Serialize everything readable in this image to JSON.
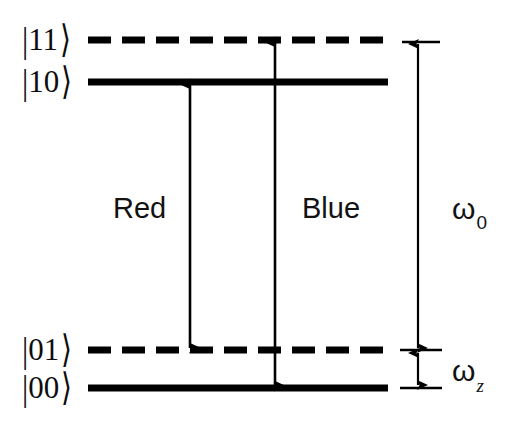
{
  "figure": {
    "width": 527,
    "height": 422,
    "background_color": "#ffffff",
    "line_color": "#000000"
  },
  "levels": [
    {
      "id": "level-11",
      "label": "|11⟩",
      "label_ket": "11",
      "style": "dashed",
      "y": 40,
      "x_start": 88,
      "x_end": 388,
      "label_x": 22,
      "label_y": 24
    },
    {
      "id": "level-10",
      "label": "|10⟩",
      "label_ket": "10",
      "style": "solid",
      "y": 82,
      "x_start": 88,
      "x_end": 388,
      "label_x": 22,
      "label_y": 66
    },
    {
      "id": "level-01",
      "label": "|01⟩",
      "label_ket": "01",
      "style": "dashed",
      "y": 350,
      "x_start": 88,
      "x_end": 388,
      "label_x": 22,
      "label_y": 334
    },
    {
      "id": "level-00",
      "label": "|00⟩",
      "label_ket": "00",
      "style": "solid",
      "y": 388,
      "x_start": 88,
      "x_end": 388,
      "label_x": 22,
      "label_y": 372
    }
  ],
  "transitions": [
    {
      "id": "red-transition",
      "label": "Red",
      "x": 190,
      "y_top": 82,
      "y_bottom": 350,
      "from_level": "|10⟩",
      "to_level": "|01⟩",
      "arrowheads": "both",
      "label_x": 113,
      "label_y": 194
    },
    {
      "id": "blue-transition",
      "label": "Blue",
      "x": 275,
      "y_top": 40,
      "y_bottom": 388,
      "from_level": "|11⟩",
      "to_level": "|00⟩",
      "arrowheads": "both",
      "label_x": 302,
      "label_y": 194
    }
  ],
  "measures": [
    {
      "id": "omega-zero",
      "symbol": "ω",
      "subscript": "0",
      "label": "ω₀",
      "x": 418,
      "y_top": 42,
      "y_bottom": 350,
      "tick_x_start": 402,
      "tick_x_end": 440,
      "arrowheads": "both",
      "label_x": 452,
      "label_y": 194,
      "description": "qubit transition frequency between |00⟩ and |10⟩"
    },
    {
      "id": "omega-z",
      "symbol": "ω",
      "subscript": "z",
      "label": "ωz",
      "x": 418,
      "y_top": 350,
      "y_bottom": 388,
      "tick_x_start": 402,
      "tick_x_end": 440,
      "arrowheads": "both",
      "label_x": 452,
      "label_y": 356,
      "description": "motional mode frequency between |00⟩ and |01⟩"
    }
  ]
}
